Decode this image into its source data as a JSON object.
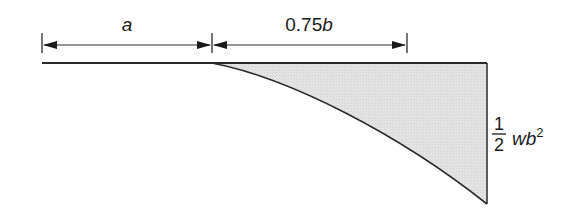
{
  "diagram": {
    "type": "bending-moment-diagram",
    "dimensions": [
      {
        "label": "a",
        "from_x": 42,
        "to_x": 212
      },
      {
        "label_num": "0.75",
        "label_var": "b",
        "from_x": 212,
        "to_x": 407
      }
    ],
    "moment_label": {
      "numerator": "1",
      "denominator": "2",
      "var": "wb",
      "exponent": "2"
    },
    "colors": {
      "line": "#2a2a2a",
      "fill": "#e2e2e2",
      "background": "#ffffff"
    }
  }
}
